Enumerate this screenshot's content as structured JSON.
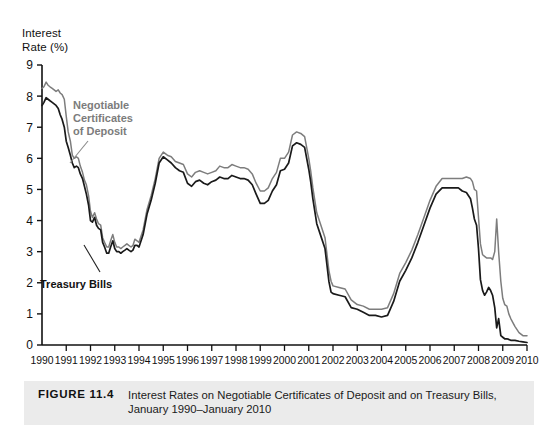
{
  "axis_title": "Interest\nRate (%)",
  "annotations": {
    "cd_label": "Negotiable\nCertificates\nof Deposit",
    "tbill_label": "Treasury Bills"
  },
  "caption": {
    "figure_number": "FIGURE 11.4",
    "text": "Interest Rates on Negotiable Certificates of Deposit and on Treasury Bills, January 1990–January 2010"
  },
  "colors": {
    "cd_line": "#7d7d7d",
    "tbill_line": "#1a1a1a",
    "axis": "#111111",
    "caption_bg": "#ebebeb"
  },
  "chart_data": {
    "type": "line",
    "title": "Interest Rates on Negotiable Certificates of Deposit and on Treasury Bills, January 1990–January 2010",
    "xlabel": "",
    "ylabel": "Interest Rate (%)",
    "xlim": [
      1990,
      2010
    ],
    "ylim": [
      0,
      9
    ],
    "yticks": [
      0,
      1,
      2,
      3,
      4,
      5,
      6,
      7,
      8,
      9
    ],
    "xticks": [
      1990,
      1991,
      1992,
      1993,
      1994,
      1995,
      1996,
      1997,
      1998,
      1999,
      2000,
      2001,
      2002,
      2003,
      2004,
      2005,
      2006,
      2007,
      2008,
      2009,
      2010
    ],
    "xtick_labels": [
      "1990",
      "1991",
      "1992",
      "1993",
      "1994",
      "1995",
      "1996",
      "1997",
      "1998",
      "1999",
      "2000",
      "2001",
      "2002",
      "2003",
      "2004",
      "2005",
      "2006",
      "2007",
      "2008",
      "2009",
      "2010"
    ],
    "grid": false,
    "legend": "inline-annotations",
    "series": [
      {
        "name": "Negotiable Certificates of Deposit",
        "color": "#7d7d7d",
        "x": [
          1990.0,
          1990.08,
          1990.17,
          1990.25,
          1990.33,
          1990.42,
          1990.5,
          1990.58,
          1990.67,
          1990.75,
          1990.83,
          1990.92,
          1991.0,
          1991.08,
          1991.17,
          1991.25,
          1991.33,
          1991.42,
          1991.5,
          1991.58,
          1991.67,
          1991.75,
          1991.83,
          1991.92,
          1992.0,
          1992.08,
          1992.17,
          1992.25,
          1992.33,
          1992.42,
          1992.5,
          1992.58,
          1992.67,
          1992.75,
          1992.83,
          1992.92,
          1993.0,
          1993.08,
          1993.17,
          1993.25,
          1993.33,
          1993.42,
          1993.5,
          1993.58,
          1993.67,
          1993.75,
          1993.83,
          1993.92,
          1994.0,
          1994.17,
          1994.33,
          1994.5,
          1994.67,
          1994.83,
          1995.0,
          1995.17,
          1995.33,
          1995.5,
          1995.67,
          1995.83,
          1996.0,
          1996.17,
          1996.33,
          1996.5,
          1996.67,
          1996.83,
          1997.0,
          1997.17,
          1997.33,
          1997.5,
          1997.67,
          1997.83,
          1998.0,
          1998.17,
          1998.33,
          1998.5,
          1998.67,
          1998.83,
          1999.0,
          1999.17,
          1999.33,
          1999.5,
          1999.67,
          1999.83,
          2000.0,
          2000.17,
          2000.33,
          2000.5,
          2000.67,
          2000.83,
          2001.0,
          2001.08,
          2001.17,
          2001.33,
          2001.5,
          2001.67,
          2001.83,
          2001.92,
          2002.0,
          2002.25,
          2002.5,
          2002.75,
          2003.0,
          2003.25,
          2003.5,
          2003.75,
          2004.0,
          2004.25,
          2004.5,
          2004.75,
          2005.0,
          2005.25,
          2005.5,
          2005.75,
          2006.0,
          2006.25,
          2006.5,
          2006.75,
          2007.0,
          2007.17,
          2007.33,
          2007.5,
          2007.67,
          2007.75,
          2007.83,
          2007.92,
          2008.0,
          2008.08,
          2008.17,
          2008.25,
          2008.33,
          2008.42,
          2008.5,
          2008.58,
          2008.67,
          2008.75,
          2008.83,
          2008.92,
          2009.0,
          2009.08,
          2009.17,
          2009.25,
          2009.33,
          2009.5,
          2009.67,
          2009.83,
          2010.0
        ],
        "y": [
          8.25,
          8.3,
          8.45,
          8.35,
          8.3,
          8.25,
          8.2,
          8.15,
          8.2,
          8.1,
          8.05,
          7.9,
          7.35,
          6.85,
          6.55,
          6.1,
          6.0,
          6.05,
          6.0,
          5.75,
          5.55,
          5.3,
          5.15,
          4.8,
          4.3,
          4.1,
          4.25,
          4.05,
          3.9,
          3.85,
          3.45,
          3.3,
          3.15,
          3.15,
          3.35,
          3.55,
          3.3,
          3.15,
          3.15,
          3.1,
          3.15,
          3.2,
          3.25,
          3.2,
          3.15,
          3.2,
          3.4,
          3.35,
          3.3,
          3.7,
          4.35,
          4.8,
          5.35,
          6.0,
          6.2,
          6.1,
          6.05,
          5.9,
          5.85,
          5.8,
          5.5,
          5.4,
          5.55,
          5.6,
          5.55,
          5.5,
          5.55,
          5.6,
          5.75,
          5.7,
          5.7,
          5.8,
          5.75,
          5.7,
          5.7,
          5.65,
          5.5,
          5.2,
          4.95,
          4.95,
          5.05,
          5.35,
          5.55,
          6.0,
          6.0,
          6.2,
          6.75,
          6.85,
          6.8,
          6.7,
          6.0,
          5.6,
          5.05,
          4.25,
          3.85,
          3.45,
          2.4,
          2.05,
          1.9,
          1.85,
          1.8,
          1.45,
          1.3,
          1.25,
          1.15,
          1.15,
          1.15,
          1.2,
          1.65,
          2.3,
          2.65,
          3.05,
          3.55,
          4.1,
          4.65,
          5.1,
          5.35,
          5.35,
          5.35,
          5.35,
          5.35,
          5.4,
          5.35,
          5.25,
          5.0,
          4.95,
          4.1,
          3.25,
          2.9,
          2.85,
          2.8,
          2.8,
          2.8,
          2.75,
          3.0,
          4.05,
          3.0,
          2.05,
          1.5,
          1.3,
          1.25,
          1.0,
          0.85,
          0.6,
          0.4,
          0.3,
          0.3
        ]
      },
      {
        "name": "Treasury Bills",
        "color": "#1a1a1a",
        "x": [
          1990.0,
          1990.08,
          1990.17,
          1990.25,
          1990.33,
          1990.42,
          1990.5,
          1990.58,
          1990.67,
          1990.75,
          1990.83,
          1990.92,
          1991.0,
          1991.08,
          1991.17,
          1991.25,
          1991.33,
          1991.42,
          1991.5,
          1991.58,
          1991.67,
          1991.75,
          1991.83,
          1991.92,
          1992.0,
          1992.08,
          1992.17,
          1992.25,
          1992.33,
          1992.42,
          1992.5,
          1992.58,
          1992.67,
          1992.75,
          1992.83,
          1992.92,
          1993.0,
          1993.08,
          1993.17,
          1993.25,
          1993.33,
          1993.42,
          1993.5,
          1993.58,
          1993.67,
          1993.75,
          1993.83,
          1993.92,
          1994.0,
          1994.17,
          1994.33,
          1994.5,
          1994.67,
          1994.83,
          1995.0,
          1995.17,
          1995.33,
          1995.5,
          1995.67,
          1995.83,
          1996.0,
          1996.17,
          1996.33,
          1996.5,
          1996.67,
          1996.83,
          1997.0,
          1997.17,
          1997.33,
          1997.5,
          1997.67,
          1997.83,
          1998.0,
          1998.17,
          1998.33,
          1998.5,
          1998.67,
          1998.83,
          1999.0,
          1999.17,
          1999.33,
          1999.5,
          1999.67,
          1999.83,
          2000.0,
          2000.17,
          2000.33,
          2000.5,
          2000.67,
          2000.83,
          2001.0,
          2001.08,
          2001.17,
          2001.33,
          2001.5,
          2001.67,
          2001.83,
          2001.92,
          2002.0,
          2002.25,
          2002.5,
          2002.75,
          2003.0,
          2003.25,
          2003.5,
          2003.75,
          2004.0,
          2004.25,
          2004.5,
          2004.75,
          2005.0,
          2005.25,
          2005.5,
          2005.75,
          2006.0,
          2006.25,
          2006.5,
          2006.75,
          2007.0,
          2007.17,
          2007.33,
          2007.5,
          2007.67,
          2007.75,
          2007.83,
          2007.92,
          2008.0,
          2008.08,
          2008.17,
          2008.25,
          2008.33,
          2008.42,
          2008.5,
          2008.58,
          2008.67,
          2008.75,
          2008.83,
          2008.92,
          2009.0,
          2009.08,
          2009.17,
          2009.25,
          2009.33,
          2009.5,
          2009.67,
          2009.83,
          2010.0
        ],
        "y": [
          7.7,
          7.8,
          7.95,
          7.9,
          7.85,
          7.8,
          7.75,
          7.7,
          7.6,
          7.4,
          7.25,
          7.0,
          6.55,
          6.35,
          6.1,
          5.85,
          5.7,
          5.75,
          5.7,
          5.5,
          5.35,
          5.1,
          4.85,
          4.5,
          4.0,
          3.95,
          4.1,
          3.85,
          3.75,
          3.7,
          3.3,
          3.15,
          2.95,
          2.95,
          3.15,
          3.35,
          3.1,
          3.0,
          3.0,
          2.95,
          3.0,
          3.05,
          3.1,
          3.05,
          3.0,
          3.05,
          3.2,
          3.2,
          3.15,
          3.55,
          4.2,
          4.65,
          5.2,
          5.85,
          6.05,
          5.95,
          5.85,
          5.7,
          5.6,
          5.55,
          5.2,
          5.1,
          5.25,
          5.3,
          5.2,
          5.15,
          5.25,
          5.3,
          5.4,
          5.35,
          5.35,
          5.45,
          5.4,
          5.35,
          5.35,
          5.3,
          5.15,
          4.85,
          4.55,
          4.55,
          4.65,
          4.95,
          5.15,
          5.6,
          5.65,
          5.85,
          6.4,
          6.5,
          6.45,
          6.35,
          5.65,
          5.25,
          4.7,
          3.9,
          3.5,
          3.1,
          2.05,
          1.7,
          1.65,
          1.6,
          1.55,
          1.2,
          1.15,
          1.05,
          0.95,
          0.95,
          0.9,
          0.95,
          1.4,
          2.05,
          2.4,
          2.8,
          3.3,
          3.85,
          4.4,
          4.85,
          5.05,
          5.05,
          5.05,
          5.05,
          4.95,
          4.9,
          4.7,
          4.4,
          4.05,
          3.85,
          3.1,
          2.1,
          1.75,
          1.6,
          1.7,
          1.85,
          1.75,
          1.6,
          1.2,
          0.55,
          0.85,
          0.3,
          0.25,
          0.2,
          0.2,
          0.18,
          0.15,
          0.15,
          0.12,
          0.1,
          0.08
        ]
      }
    ]
  }
}
